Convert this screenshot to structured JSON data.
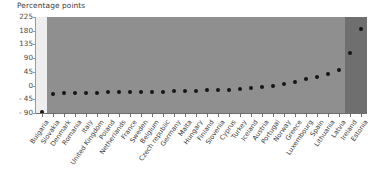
{
  "axis": {
    "y_title": "Percentage points",
    "y_ticks": [
      225,
      180,
      135,
      90,
      45,
      0,
      -45,
      -90
    ],
    "y_tick_labels": [
      "225",
      "180",
      "135",
      "90",
      "45",
      "0",
      "- 45",
      "- 90"
    ],
    "ylim": [
      -90,
      225
    ]
  },
  "colors": {
    "band_left": "#eeeeee",
    "band_middle": "#8f8f8f",
    "band_right": "#6f6f6f",
    "marker": "#151515",
    "axis": "#6e6e6e",
    "text": "#3d3d3d"
  },
  "bands": [
    {
      "name": "band-left",
      "start_index": 0,
      "end_index": 1,
      "color": "#eeeeee"
    },
    {
      "name": "band-middle",
      "start_index": 1,
      "end_index": 28,
      "color": "#8f8f8f"
    },
    {
      "name": "band-right",
      "start_index": 28,
      "end_index": 30,
      "color": "#6f6f6f"
    }
  ],
  "chart_data": {
    "type": "scatter",
    "title": "",
    "xlabel": "",
    "ylabel": "Percentage points",
    "ylim": [
      -90,
      225
    ],
    "grid": false,
    "legend": "none",
    "categories": [
      "Bulgaria",
      "Slovakia",
      "Denmark",
      "Romania",
      "Italy",
      "United Kingdom",
      "Poland",
      "Netherlands",
      "France",
      "Sweden",
      "Belgium",
      "Czech republic",
      "Germany",
      "Malta",
      "Hungary",
      "Finland",
      "Slovenia",
      "Cyprus",
      "Turkey",
      "Iceland",
      "Austria",
      "Portugal",
      "Norway",
      "Greece",
      "Luxembourg",
      "Spain",
      "Lithuania",
      "Latvia",
      "Ireland",
      "Estonia"
    ],
    "values": [
      -88,
      -28,
      -25,
      -24,
      -23,
      -23,
      -22,
      -22,
      -21,
      -21,
      -20,
      -20,
      -19,
      -18,
      -17,
      -16,
      -15,
      -13,
      -11,
      -8,
      -5,
      0,
      6,
      13,
      20,
      28,
      38,
      52,
      108,
      186
    ]
  }
}
